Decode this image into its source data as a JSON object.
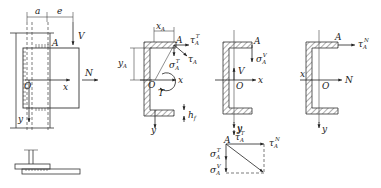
{
  "figure": {
    "panel_a": {
      "labels": {
        "a": "a",
        "e": "e",
        "V": "V",
        "A": "A",
        "N": "N",
        "O": "O",
        "x": "x",
        "y": "y"
      }
    },
    "panel_b": {
      "labels": {
        "xA": "x",
        "xA_sub": "A",
        "yA": "y",
        "yA_sub": "A",
        "A": "A",
        "tauT": "τ",
        "tauT_sub": "A",
        "tauT_sup": "T",
        "tauA": "τ",
        "tauA_sub": "A",
        "sigmaT": "σ",
        "sigmaT_sub": "A",
        "sigmaT_sup": "T",
        "O": "O",
        "x": "x",
        "T": "T",
        "y": "y",
        "hf": "h",
        "hf_sub": "f"
      }
    },
    "panel_c": {
      "labels": {
        "A": "A",
        "sigmaV": "σ",
        "sigmaV_sub": "A",
        "sigmaV_sup": "V",
        "V": "V",
        "O": "O",
        "x": "x",
        "y": "y"
      }
    },
    "panel_d": {
      "labels": {
        "A": "A",
        "tauN": "τ",
        "tauN_sub": "A",
        "tauN_sup": "N",
        "x": "x",
        "O": "O",
        "N": "N",
        "y": "y"
      }
    },
    "vector_diagram": {
      "labels": {
        "y": "y",
        "A": "A",
        "tauT": "τ",
        "tauT_sub": "A",
        "tauT_sup": "T",
        "tauN": "τ",
        "tauN_sub": "A",
        "tauN_sup": "N",
        "sigmaT": "σ",
        "sigmaT_sub": "A",
        "sigmaT_sup": "T",
        "sigmaV": "σ",
        "sigmaV_sub": "A",
        "sigmaV_sup": "V"
      }
    }
  }
}
